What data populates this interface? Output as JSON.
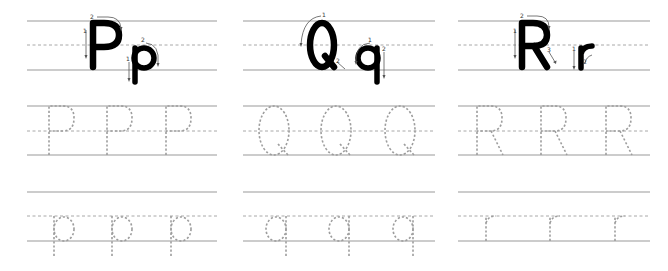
{
  "worksheet": {
    "title": "Letter tracing worksheet P Q R",
    "colors": {
      "ink": "#000000",
      "ruled_line": "#9a9a9a",
      "dashed_line": "#a8a8a8",
      "trace": "#9d9d9d"
    },
    "rows": [
      {
        "name": "model",
        "top": 21,
        "mid": 45,
        "base": 70
      },
      {
        "name": "uppercase-trace",
        "top": 106,
        "mid": 131,
        "base": 155
      },
      {
        "name": "lowercase-trace",
        "top": 192,
        "mid": 216,
        "base": 241
      }
    ],
    "columns": [
      {
        "letter_upper": "P",
        "letter_lower": "p",
        "x_start": 27,
        "x_end": 217,
        "stroke_numbers": {
          "upper": [
            "1",
            "2"
          ],
          "lower": [
            "1",
            "2"
          ]
        },
        "trace_upper_count": 3,
        "trace_lower_count": 3
      },
      {
        "letter_upper": "Q",
        "letter_lower": "q",
        "x_start": 243,
        "x_end": 435,
        "stroke_numbers": {
          "upper": [
            "1",
            "2"
          ],
          "lower": [
            "1",
            "2"
          ]
        },
        "trace_upper_count": 3,
        "trace_lower_count": 3
      },
      {
        "letter_upper": "R",
        "letter_lower": "r",
        "x_start": 458,
        "x_end": 650,
        "stroke_numbers": {
          "upper": [
            "1",
            "2",
            "3"
          ],
          "lower": [
            "1",
            "2"
          ]
        },
        "trace_upper_count": 3,
        "trace_lower_count": 3
      }
    ]
  }
}
